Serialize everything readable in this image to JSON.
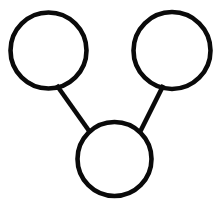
{
  "canvas": {
    "width": 219,
    "height": 200,
    "background_color": "#ffffff",
    "stroke_color": "#0a0a0a",
    "title": "Three-node connected graph"
  },
  "diagram": {
    "type": "node-link-graph",
    "node_count": 3,
    "edge_count": 2,
    "node_fill": "#ffffff",
    "node_stroke": "#0a0a0a",
    "node_stroke_width": 4.6,
    "edge_stroke": "#0a0a0a",
    "edge_stroke_width": 4.6,
    "nodes": [
      {
        "id": "node-top-left",
        "label": "",
        "cx": 48.5,
        "cy": 50.5,
        "r": 38.0
      },
      {
        "id": "node-top-right",
        "label": "",
        "cx": 172.0,
        "cy": 50.5,
        "r": 38.5
      },
      {
        "id": "node-bottom-center",
        "label": "",
        "cx": 114.5,
        "cy": 159.0,
        "r": 37.0
      }
    ],
    "edges": [
      {
        "id": "edge-top-left-to-bottom",
        "from": "node-top-left",
        "to": "node-bottom-center",
        "x1": 56.5,
        "y1": 85.0,
        "x2": 89.5,
        "y2": 131.5
      },
      {
        "id": "edge-top-right-to-bottom",
        "from": "node-top-right",
        "to": "node-bottom-center",
        "x1": 163.5,
        "y1": 85.0,
        "x2": 140.5,
        "y2": 131.0
      }
    ]
  }
}
